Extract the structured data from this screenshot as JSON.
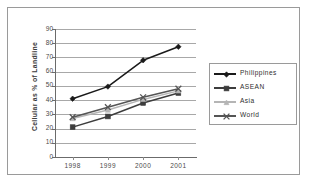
{
  "chart_data": {
    "type": "line",
    "title": "",
    "xlabel": "",
    "ylabel": "Cellular as % of Landline",
    "categories": [
      "1998",
      "1999",
      "2000",
      "2001"
    ],
    "ylim": [
      0,
      90
    ],
    "ytick_step": 10,
    "yticks": [
      "0",
      "10",
      "20",
      "30",
      "40",
      "50",
      "60",
      "70",
      "80",
      "90"
    ],
    "grid": "horizontal",
    "legend_position": "right",
    "series": [
      {
        "name": "Philippines",
        "marker": "diamond",
        "color": "#1a1a1a",
        "values": [
          41,
          49.5,
          68,
          77.5
        ]
      },
      {
        "name": "ASEAN",
        "marker": "square",
        "color": "#3d3d3d",
        "values": [
          21,
          28.5,
          38,
          45
        ]
      },
      {
        "name": "Asia",
        "marker": "triangle",
        "color": "#b5b5b5",
        "values": [
          27,
          33,
          40.5,
          46.5
        ]
      },
      {
        "name": "World",
        "marker": "cross",
        "color": "#555555",
        "values": [
          28,
          35,
          42,
          48
        ]
      }
    ]
  },
  "colors": {
    "frame_border": "#9a9a9a",
    "gridline": "#a8a8a8",
    "axis": "#6b6b6b",
    "tick_text": "#4a4a4a",
    "background": "#ffffff"
  }
}
